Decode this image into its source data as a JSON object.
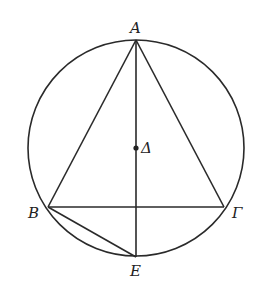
{
  "diagram": {
    "type": "geometry",
    "circle": {
      "cx": 136,
      "cy": 148,
      "r": 108,
      "center_label": "Δ"
    },
    "points": {
      "A": {
        "label": "A",
        "x": 136,
        "y": 40
      },
      "B": {
        "label": "B",
        "x": 48,
        "y": 207
      },
      "G": {
        "label": "Γ",
        "x": 224,
        "y": 207
      },
      "D": {
        "label": "Δ",
        "x": 136,
        "y": 148
      },
      "E": {
        "label": "E",
        "x": 136,
        "y": 257
      }
    },
    "segments": [
      "AB",
      "AΓ",
      "BΓ",
      "AE",
      "BE"
    ]
  }
}
